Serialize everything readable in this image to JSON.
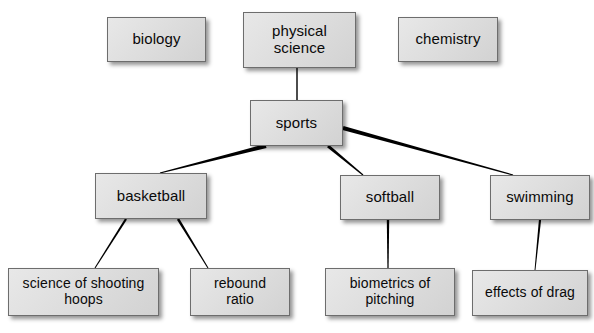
{
  "diagram": {
    "type": "concept-map",
    "title": "",
    "style": {
      "box_fill": "#dcdcdc",
      "box_border": "#6d6d6d",
      "text_color": "#0a0a0a",
      "line_color": "#000000",
      "background": "#ffffff",
      "shadow": "rgba(0,0,0,0.42)"
    },
    "nodes": [
      {
        "id": "biology",
        "label": "biology",
        "x": 107,
        "y": 17,
        "w": 99,
        "h": 45,
        "font": 15
      },
      {
        "id": "physical",
        "label": "physical\nscience",
        "x": 243,
        "y": 12,
        "w": 113,
        "h": 56,
        "font": 15
      },
      {
        "id": "chemistry",
        "label": "chemistry",
        "x": 398,
        "y": 17,
        "w": 100,
        "h": 45,
        "font": 15
      },
      {
        "id": "sports",
        "label": "sports",
        "x": 250,
        "y": 100,
        "w": 93,
        "h": 46,
        "font": 15
      },
      {
        "id": "basketball",
        "label": "basketball",
        "x": 95,
        "y": 173,
        "w": 112,
        "h": 46,
        "font": 15
      },
      {
        "id": "softball",
        "label": "softball",
        "x": 340,
        "y": 175,
        "w": 100,
        "h": 45,
        "font": 15
      },
      {
        "id": "swimming",
        "label": "swimming",
        "x": 490,
        "y": 175,
        "w": 100,
        "h": 45,
        "font": 15
      },
      {
        "id": "shooting-hoops",
        "label": "science of shooting\nhoops",
        "x": 8,
        "y": 268,
        "w": 151,
        "h": 48,
        "font": 14
      },
      {
        "id": "rebound-ratio",
        "label": "rebound\nratio",
        "x": 190,
        "y": 268,
        "w": 100,
        "h": 48,
        "font": 14
      },
      {
        "id": "biometrics",
        "label": "biometrics of\npitching",
        "x": 325,
        "y": 268,
        "w": 130,
        "h": 48,
        "font": 14
      },
      {
        "id": "effects-drag",
        "label": "effects of drag",
        "x": 472,
        "y": 270,
        "w": 116,
        "h": 46,
        "font": 14
      }
    ],
    "edges": [
      {
        "id": "physical-sports",
        "from": "physical",
        "to": "sports",
        "x1": 297,
        "y1": 68,
        "x2": 297,
        "y2": 100,
        "w1": 1.4,
        "w2": 1.4
      },
      {
        "id": "sports-basketball",
        "from": "sports",
        "to": "basketball",
        "x1": 266,
        "y1": 146,
        "x2": 160,
        "y2": 173,
        "w1": 4.2,
        "w2": 1.2
      },
      {
        "id": "sports-softball",
        "from": "sports",
        "to": "softball",
        "x1": 328,
        "y1": 146,
        "x2": 363,
        "y2": 175,
        "w1": 3.0,
        "w2": 1.2
      },
      {
        "id": "sports-swimming",
        "from": "sports",
        "to": "swimming",
        "x1": 343,
        "y1": 128,
        "x2": 513,
        "y2": 175,
        "w1": 4.0,
        "w2": 1.2
      },
      {
        "id": "basketball-hoops",
        "from": "basketball",
        "to": "shooting-hoops",
        "x1": 126,
        "y1": 219,
        "x2": 95,
        "y2": 268,
        "w1": 2.3,
        "w2": 1.0
      },
      {
        "id": "basketball-rebound",
        "from": "basketball",
        "to": "rebound-ratio",
        "x1": 178,
        "y1": 219,
        "x2": 208,
        "y2": 268,
        "w1": 2.5,
        "w2": 1.0
      },
      {
        "id": "softball-biometrics",
        "from": "softball",
        "to": "biometrics",
        "x1": 388,
        "y1": 220,
        "x2": 388,
        "y2": 268,
        "w1": 2.4,
        "w2": 1.2
      },
      {
        "id": "swimming-effects",
        "from": "swimming",
        "to": "effects-drag",
        "x1": 540,
        "y1": 220,
        "x2": 535,
        "y2": 270,
        "w1": 2.2,
        "w2": 0.9
      }
    ]
  }
}
